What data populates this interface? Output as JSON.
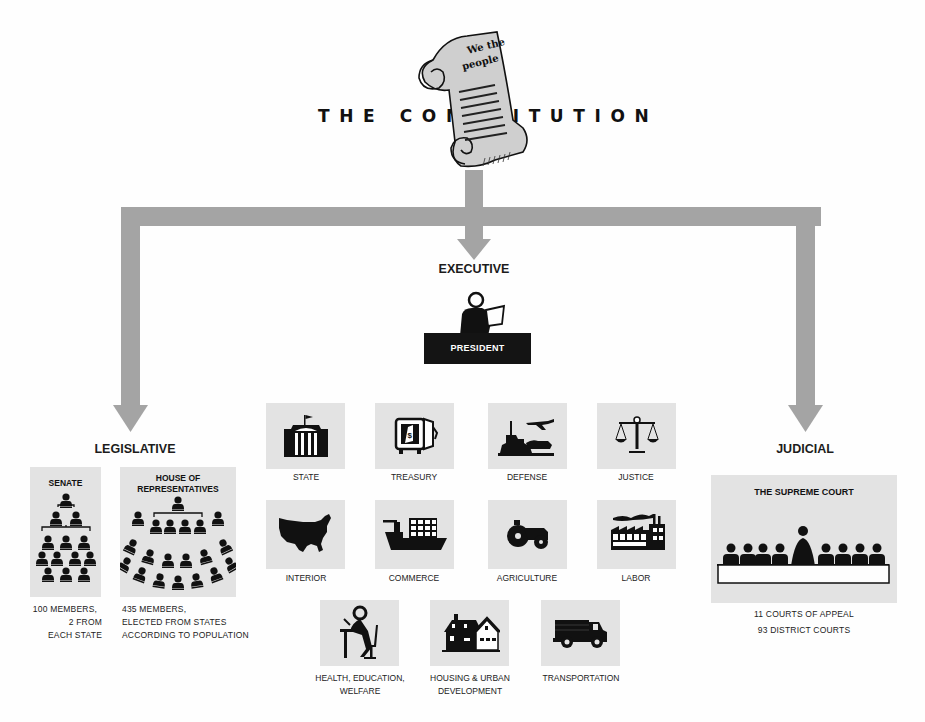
{
  "title": "THE CONSTITUTION",
  "scroll": {
    "line1": "We the",
    "line2": "people"
  },
  "colors": {
    "arrow": "#a4a4a4",
    "panel": "#e3e3e3",
    "ink": "#111111",
    "background": "#fefefe"
  },
  "branches": {
    "executive": {
      "heading": "EXECUTIVE",
      "leader_label": "PRESIDENT",
      "departments": [
        {
          "name": "STATE",
          "icon": "capitol-building-icon"
        },
        {
          "name": "TREASURY",
          "icon": "safe-icon"
        },
        {
          "name": "DEFENSE",
          "icon": "battleship-plane-tank-icon"
        },
        {
          "name": "JUSTICE",
          "icon": "scales-icon"
        },
        {
          "name": "INTERIOR",
          "icon": "us-map-icon"
        },
        {
          "name": "COMMERCE",
          "icon": "cargo-ship-icon"
        },
        {
          "name": "AGRICULTURE",
          "icon": "tractor-icon"
        },
        {
          "name": "LABOR",
          "icon": "factory-icon"
        },
        {
          "name": "HEALTH, EDUCATION,",
          "name2": "WELFARE",
          "icon": "person-at-desk-icon"
        },
        {
          "name": "HOUSING & URBAN",
          "name2": "DEVELOPMENT",
          "icon": "houses-icon"
        },
        {
          "name": "TRANSPORTATION",
          "icon": "truck-icon"
        }
      ]
    },
    "legislative": {
      "heading": "LEGISLATIVE",
      "senate": {
        "title": "SENATE",
        "caption": [
          "100 MEMBERS,",
          "2 FROM",
          "EACH STATE"
        ]
      },
      "house": {
        "title_line1": "HOUSE OF",
        "title_line2": "REPRESENTATIVES",
        "caption": [
          "435 MEMBERS,",
          "ELECTED FROM STATES",
          "ACCORDING TO POPULATION"
        ]
      }
    },
    "judicial": {
      "heading": "JUDICIAL",
      "court_title": "THE SUPREME COURT",
      "caption": [
        "11 COURTS OF APPEAL",
        "93 DISTRICT COURTS"
      ]
    }
  }
}
